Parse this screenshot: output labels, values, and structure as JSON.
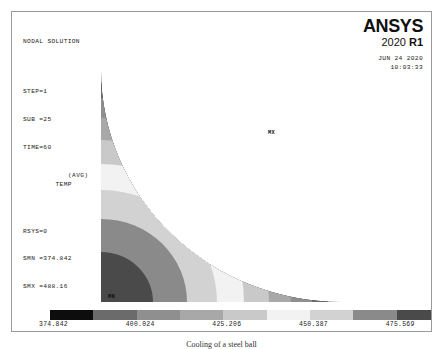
{
  "header": {
    "lines": [
      "NODAL SOLUTION",
      "STEP=1",
      "SUB =25",
      "TIME=60",
      "RSYS=0",
      "SMN =374.842",
      "SMX =488.16"
    ],
    "title": "NODAL SOLUTION",
    "step": "STEP=1",
    "sub": "SUB =25",
    "time": "TIME=60",
    "temp": "TEMP",
    "temp_qualifier": "(AVG)",
    "rsys": "RSYS=0",
    "smn": "SMN =374.842",
    "smx": "SMX =488.16"
  },
  "logo": {
    "brand": "ANSYS",
    "version_year": "2020",
    "version_release": "R1",
    "date": "JUN 24 2020",
    "time": "10:03:33"
  },
  "plot": {
    "min_label": "MN",
    "max_label": "MX",
    "caption": "Cooling of a steel ball",
    "colors": [
      "#0d0d0d",
      "#6b6b6b",
      "#8f8f8f",
      "#a8a8a8",
      "#c9c9c9",
      "#f2f2f2",
      "#d2d2d2",
      "#8a8a8a",
      "#4a4a4a"
    ]
  },
  "figure": {
    "caption": "Cooling of a steel ball"
  },
  "chart_data": {
    "type": "heatmap",
    "title": "Cooling of a steel ball",
    "subtitle": "NODAL SOLUTION  STEP=1  SUB =25  TIME=60  TEMP (AVG)  RSYS=0",
    "quantity": "TEMP",
    "averaging": "AVG",
    "smn": 374.842,
    "smx": 488.16,
    "colorbar_min": 374.842,
    "colorbar_max": 488.16,
    "band_count": 9,
    "tick_labels": [
      "374.842",
      "387.433",
      "400.024",
      "412.615",
      "425.206",
      "437.797",
      "450.387",
      "462.978",
      "475.569",
      "488.16"
    ],
    "tick_values": [
      374.842,
      387.433,
      400.024,
      412.615,
      425.206,
      437.797,
      450.387,
      462.978,
      475.569,
      488.16
    ],
    "tick_row": [
      "top",
      "bottom",
      "top",
      "bottom",
      "top",
      "bottom",
      "top",
      "bottom",
      "top",
      "bottom"
    ],
    "band_colors": [
      "#0d0d0d",
      "#6b6b6b",
      "#8f8f8f",
      "#a8a8a8",
      "#c9c9c9",
      "#f2f2f2",
      "#d2d2d2",
      "#8a8a8a",
      "#4a4a4a"
    ],
    "geometry": "axisymmetric quarter disk of a sphere",
    "annotations": [
      {
        "label": "MN",
        "position": "inner lower-left corner"
      },
      {
        "label": "MX",
        "position": "outer arc surface"
      }
    ],
    "xlabel": "",
    "ylabel": "",
    "grid": false,
    "legend": "horizontal colorbar below plot"
  }
}
